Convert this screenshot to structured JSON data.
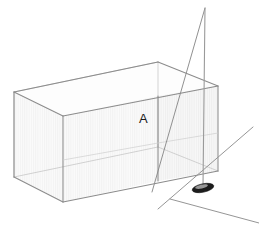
{
  "figure": {
    "background_color": "#ffffff",
    "width": 259,
    "height": 227
  },
  "labels": [
    {
      "id": "point-a",
      "text": "A",
      "x": 139,
      "y": 123,
      "color": "#1a1a1a"
    }
  ],
  "colors": {
    "edge_stroke": "#8c8c8c",
    "edge_stroke_dark": "#6e6e6e",
    "hidden_edge_stroke": "#b4b4b4",
    "face_front": "#fafafa",
    "face_right": "#f5f5f5",
    "face_top": "#fdfdfd",
    "pole_stroke": "#9a9a9a",
    "guy_line_stroke": "#8a8a8a",
    "ground_line_stroke": "#8f8f8f",
    "base_fill": "#1c1c1c",
    "label_color": "#1a1a1a"
  },
  "box": {
    "name": "transparent-rectangular-box",
    "vertices": {
      "top_back_left": [
        14,
        92
      ],
      "top_back_right": [
        158,
        62
      ],
      "top_front_right": [
        218,
        86
      ],
      "top_front_left": [
        63,
        116
      ],
      "bottom_back_left": [
        14,
        177
      ],
      "bottom_back_right": [
        158,
        147
      ],
      "bottom_front_right": [
        218,
        171
      ],
      "bottom_front_left": [
        63,
        202
      ]
    },
    "opacity": "transparent",
    "faces": [
      "top",
      "front-left",
      "front-right"
    ]
  },
  "pole": {
    "name": "vertical-pole",
    "top": [
      205,
      8
    ],
    "bottom": [
      203,
      186
    ],
    "base_ellipse": {
      "cx": 203,
      "cy": 188,
      "rx": 11,
      "ry": 4.2,
      "rotation": -12
    }
  },
  "guy_line": {
    "name": "guy-line",
    "from": [
      205,
      8
    ],
    "to": [
      152,
      192
    ]
  },
  "ground_lines": [
    {
      "name": "ground-line-front",
      "from": [
        170,
        199
      ],
      "to": [
        259,
        223
      ]
    },
    {
      "name": "ground-line-right",
      "from": [
        253,
        127
      ],
      "to": [
        158,
        209
      ]
    }
  ]
}
